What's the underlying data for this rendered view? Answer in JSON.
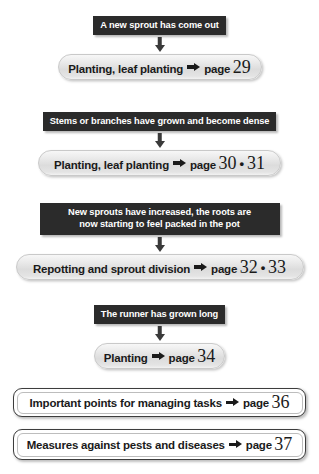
{
  "diagram": {
    "colors": {
      "banner_bg": "#2b2b2b",
      "banner_text": "#ffffff",
      "pill_bg": "#e4e4e4",
      "page_bg": "#ffffff",
      "text": "#1a1a1a"
    },
    "word_page": "page",
    "dot_separator": "•",
    "arrow_icon": "right-arrow",
    "connector_icon": "down-arrow"
  },
  "sections": [
    {
      "condition": "A new sprout has come out",
      "condition_line2": "",
      "action": "Planting, leaf planting",
      "page": "29",
      "page2": ""
    },
    {
      "condition": "Stems or branches have grown and become dense",
      "condition_line2": "",
      "action": "Planting, leaf planting",
      "page": "30",
      "page2": "31"
    },
    {
      "condition": "New sprouts have increased, the roots are",
      "condition_line2": "now starting to feel packed in the pot",
      "action": "Repotting and sprout division",
      "page": "32",
      "page2": "33"
    },
    {
      "condition": "The runner has grown long",
      "condition_line2": "",
      "action": "Planting",
      "page": "34",
      "page2": ""
    }
  ],
  "footer_boxes": [
    {
      "label": "Important points for managing tasks",
      "page": "36"
    },
    {
      "label": "Measures against pests and diseases",
      "page": "37"
    }
  ]
}
